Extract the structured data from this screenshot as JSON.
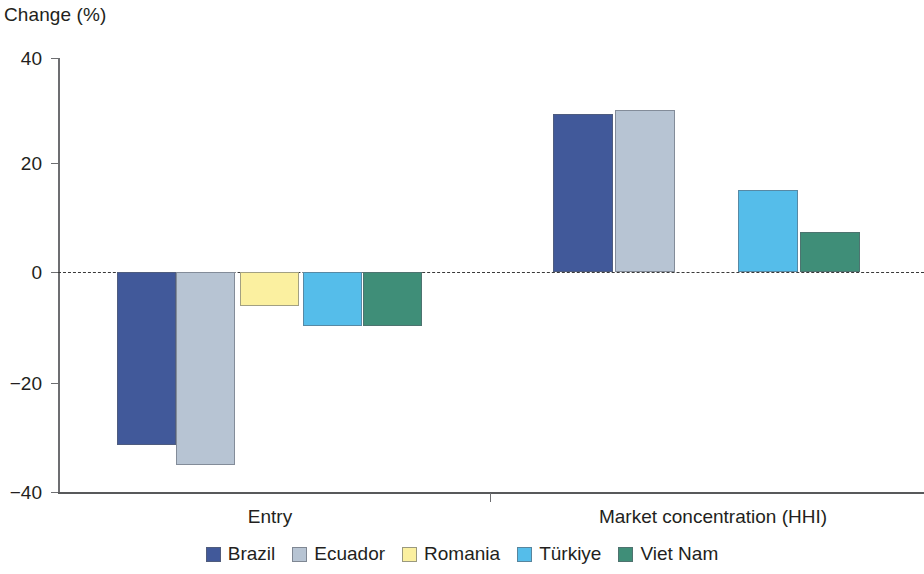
{
  "chart_data": {
    "type": "bar",
    "title": "",
    "ylabel": "Change (%)",
    "xlabel": "",
    "ylim": [
      -40,
      40
    ],
    "yticks": [
      40,
      20,
      0,
      -20,
      -40
    ],
    "ytick_labels": [
      "40",
      "20",
      "0",
      "−20",
      "−40"
    ],
    "grid": false,
    "zero_line": true,
    "legend_position": "bottom",
    "categories": [
      "Entry",
      "Market concentration (HHI)"
    ],
    "series": [
      {
        "name": "Brazil",
        "color": "#41599a",
        "values": [
          -31.8,
          29.2
        ]
      },
      {
        "name": "Ecuador",
        "color": "#b7c4d3",
        "values": [
          -35.6,
          29.8
        ]
      },
      {
        "name": "Romania",
        "color": "#fbf0a0",
        "values": [
          -6.3,
          null
        ]
      },
      {
        "name": "Türkiye",
        "color": "#55bdea",
        "values": [
          -10.0,
          15.2
        ]
      },
      {
        "name": "Viet Nam",
        "color": "#3f8e78",
        "values": [
          -10.0,
          7.4
        ]
      }
    ]
  },
  "axis": {
    "ylabel": "Change (%)",
    "tick_40": "40",
    "tick_20": "20",
    "tick_0": "0",
    "tick_neg20": "−20",
    "tick_neg40": "−40"
  },
  "groups": {
    "entry": "Entry",
    "hhi": "Market concentration (HHI)"
  },
  "legend": {
    "items": [
      {
        "label": "Brazil"
      },
      {
        "label": "Ecuador"
      },
      {
        "label": "Romania"
      },
      {
        "label": "Türkiye"
      },
      {
        "label": "Viet Nam"
      }
    ]
  }
}
